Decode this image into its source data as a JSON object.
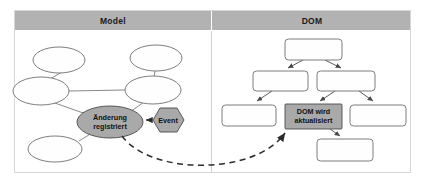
{
  "figure": {
    "background_color": "#ffffff",
    "frame": {
      "x": 14,
      "y": 10,
      "width": 397,
      "height": 163
    }
  },
  "colors": {
    "header_band": "#b2b2b2",
    "node_gray_fill": "#a9a9a9",
    "node_white_fill": "#fefefe",
    "node_stroke": "#6e6e6e",
    "arrow_dark": "#2b2b2b",
    "divider": "#cfcfcf",
    "text": "#111111"
  },
  "panels": [
    {
      "id": "model",
      "header_label": "Model",
      "header_center_x": 113,
      "region": {
        "x": 14,
        "y": 30,
        "width": 198,
        "height": 143
      }
    },
    {
      "id": "dom",
      "header_label": "DOM",
      "header_center_x": 312,
      "region": {
        "x": 212,
        "y": 30,
        "width": 199,
        "height": 143
      }
    }
  ],
  "model_graph": {
    "type": "node-link",
    "nodes": [
      {
        "id": "m1",
        "shape": "ellipse",
        "label": "",
        "cx": 59,
        "cy": 60,
        "rx": 26,
        "ry": 13,
        "fill": "white"
      },
      {
        "id": "m2",
        "shape": "ellipse",
        "label": "",
        "cx": 156,
        "cy": 58,
        "rx": 26,
        "ry": 13,
        "fill": "white"
      },
      {
        "id": "m3",
        "shape": "ellipse",
        "label": "",
        "cx": 41,
        "cy": 91,
        "rx": 28,
        "ry": 14,
        "fill": "white"
      },
      {
        "id": "m4",
        "shape": "ellipse",
        "label": "",
        "cx": 153,
        "cy": 90,
        "rx": 28,
        "ry": 14,
        "fill": "white"
      },
      {
        "id": "m5",
        "shape": "ellipse",
        "label": "",
        "cx": 55,
        "cy": 149,
        "rx": 27,
        "ry": 13,
        "fill": "white"
      },
      {
        "id": "m_change",
        "shape": "ellipse",
        "label": "Änderung registriert",
        "label_lines": [
          "Änderung",
          "registriert"
        ],
        "cx": 110,
        "cy": 122,
        "rx": 33,
        "ry": 16,
        "fill": "gray"
      },
      {
        "id": "m_event",
        "shape": "hexagon",
        "label": "Event",
        "label_lines": [
          "Event"
        ],
        "cx": 168,
        "cy": 120,
        "rx": 21,
        "ry": 12,
        "fill": "gray"
      }
    ],
    "edges": [
      {
        "from": "m1",
        "to": "m3",
        "style": "solid"
      },
      {
        "from": "m2",
        "to": "m4",
        "style": "solid"
      },
      {
        "from": "m3",
        "to": "m4",
        "style": "solid"
      },
      {
        "from": "m3",
        "to": "m_change",
        "style": "solid"
      },
      {
        "from": "m4",
        "to": "m_change",
        "style": "solid"
      },
      {
        "from": "m5",
        "to": "m_change",
        "style": "solid"
      },
      {
        "from": "m_event",
        "to": "m_change",
        "style": "arrow",
        "direction": "left"
      }
    ]
  },
  "dom_tree": {
    "type": "tree",
    "nodes": [
      {
        "id": "d_root",
        "shape": "rect",
        "label": "",
        "x": 285,
        "y": 39,
        "width": 57,
        "height": 21,
        "fill": "white"
      },
      {
        "id": "d_l1",
        "shape": "rect",
        "label": "",
        "x": 253,
        "y": 71,
        "width": 55,
        "height": 20,
        "fill": "white"
      },
      {
        "id": "d_r1",
        "shape": "rect",
        "label": "",
        "x": 317,
        "y": 71,
        "width": 58,
        "height": 20,
        "fill": "white"
      },
      {
        "id": "d_ll",
        "shape": "rect",
        "label": "",
        "x": 222,
        "y": 105,
        "width": 54,
        "height": 21,
        "fill": "white"
      },
      {
        "id": "d_mid",
        "shape": "rect",
        "label": "DOM wird aktualisiert",
        "label_lines": [
          "DOM wird",
          "aktualisiert"
        ],
        "x": 285,
        "y": 104,
        "width": 57,
        "height": 25,
        "fill": "gray"
      },
      {
        "id": "d_rr",
        "shape": "rect",
        "label": "",
        "x": 350,
        "y": 105,
        "width": 56,
        "height": 21,
        "fill": "white"
      },
      {
        "id": "d_leaf",
        "shape": "rect",
        "label": "",
        "x": 317,
        "y": 139,
        "width": 56,
        "height": 22,
        "fill": "white"
      }
    ],
    "edges": [
      {
        "from": "d_root",
        "to": "d_l1",
        "style": "arrow"
      },
      {
        "from": "d_root",
        "to": "d_r1",
        "style": "arrow"
      },
      {
        "from": "d_l1",
        "to": "d_ll",
        "style": "arrow"
      },
      {
        "from": "d_r1",
        "to": "d_mid",
        "style": "arrow"
      },
      {
        "from": "d_r1",
        "to": "d_rr",
        "style": "arrow"
      },
      {
        "from": "d_mid",
        "to": "d_leaf",
        "style": "arrow"
      }
    ]
  },
  "cross_link": {
    "id": "change-to-dom",
    "style": "dashed-curved-arrow",
    "from": "m_change",
    "to": "d_mid",
    "description": "Änderung registriert triggers DOM wird aktualisiert"
  }
}
